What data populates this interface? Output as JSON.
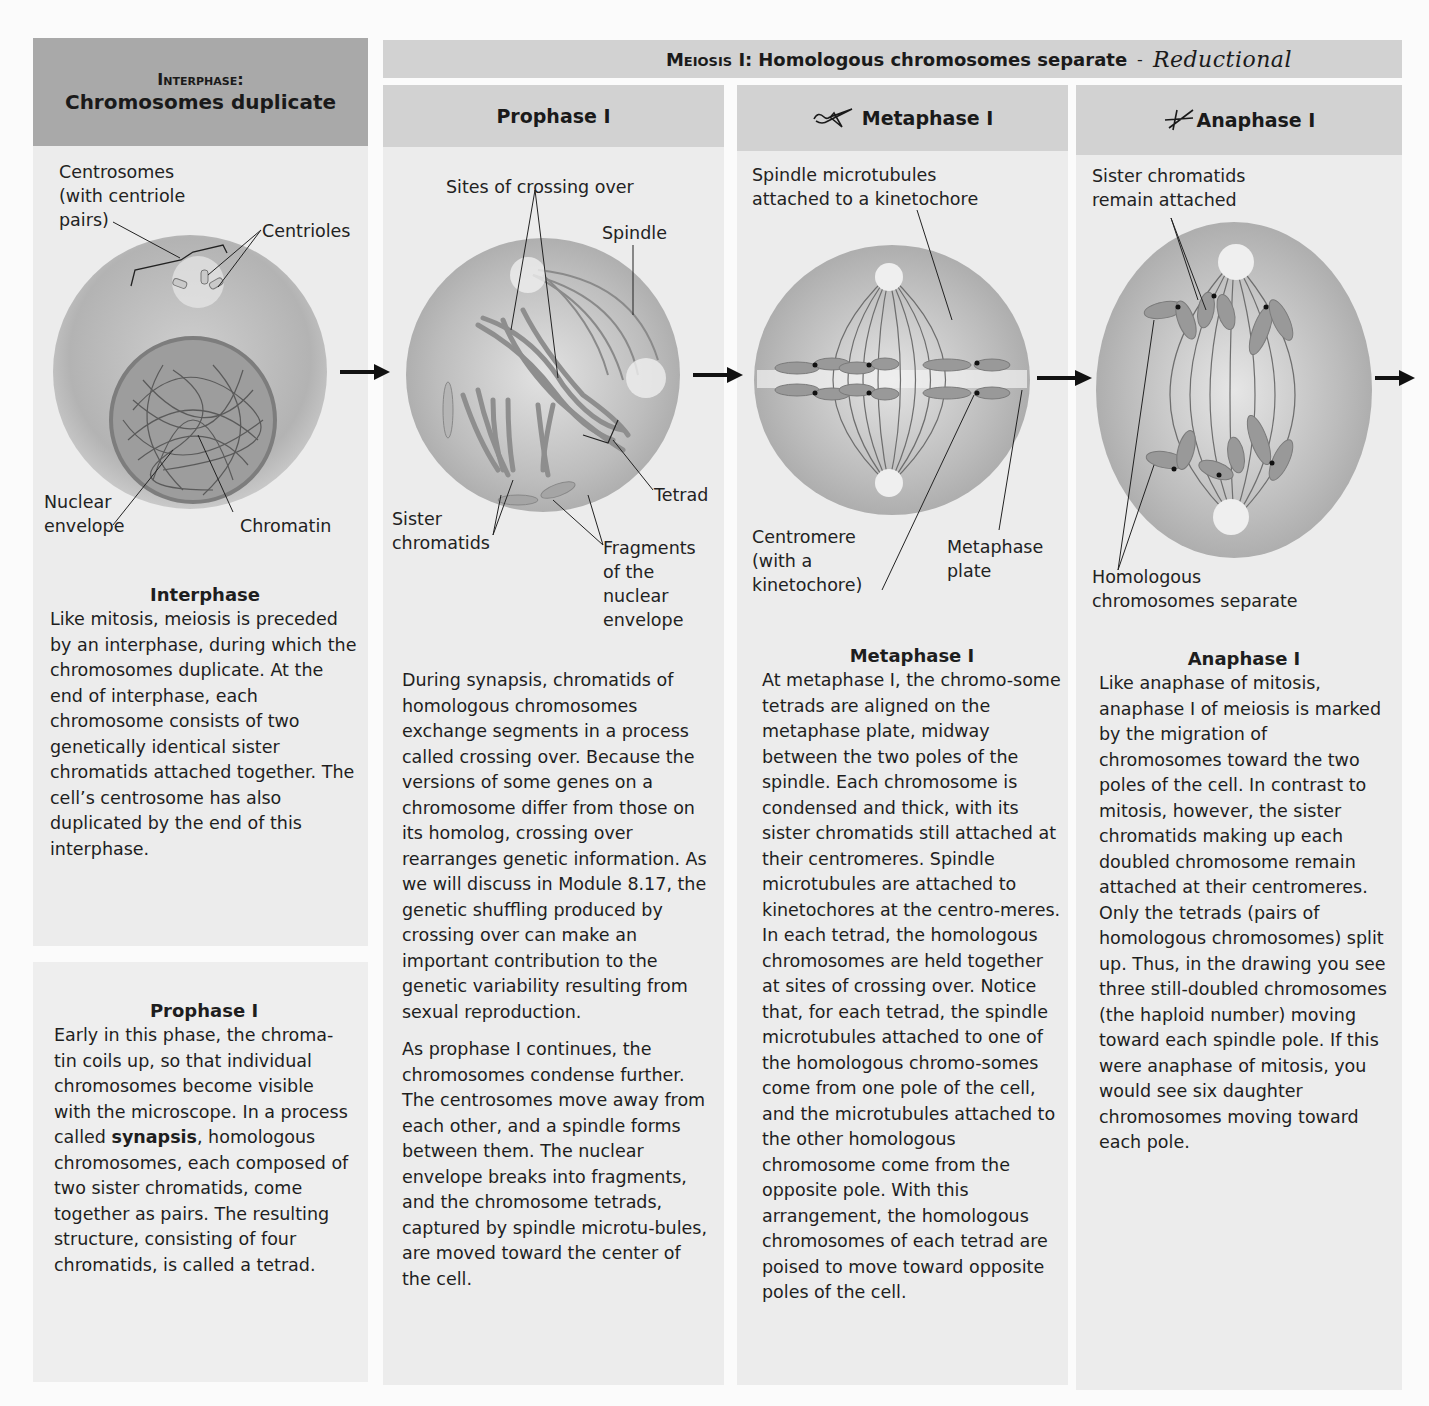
{
  "interphase": {
    "header_line1": "Interphase:",
    "header_line2": "Chromosomes duplicate",
    "labels": {
      "centrosomes": "Centrosomes\n(with centriole\npairs)",
      "centrioles": "Centrioles",
      "nuclear_envelope": "Nuclear\nenvelope",
      "chromatin": "Chromatin"
    },
    "text_title": "Interphase",
    "text_body": "Like mitosis, meiosis is preceded by an interphase, during which the chromosomes duplicate. At the end of interphase, each chromosome consists of two genetically identical sister chromatids attached together. The cell’s centrosome has also duplicated by the end of this interphase.",
    "prophase_box_title": "Prophase I",
    "prophase_box_before": "Early in this phase, the chroma-tin coils up, so that individual chromosomes become visible with the microscope. In a process called ",
    "prophase_box_bold": "synapsis",
    "prophase_box_after": ", homologous chromosomes, each composed of two sister chromatids, come together as pairs. The resulting structure, consisting of four chromatids, is called a tetrad."
  },
  "meiosis_banner": {
    "prefix": "Meiosis I:",
    "title": "Homologous chromosomes separate",
    "dash": "-",
    "handwritten_note": "Reductional"
  },
  "prophase": {
    "header": "Prophase I",
    "labels": {
      "crossing_over": "Sites of crossing over",
      "spindle": "Spindle",
      "tetrad": "Tetrad",
      "sister_chromatids": "Sister\nchromatids",
      "fragments": "Fragments\nof the\nnuclear\nenvelope"
    },
    "text_p1": "During synapsis, chromatids of homologous chromosomes exchange segments in a process called crossing over. Because the versions of some genes on a chromosome differ from those on its homolog, crossing over rearranges genetic information. As we will discuss in Module 8.17, the genetic shuffling produced by crossing over can make an important contribution to the genetic variability resulting from sexual reproduction.",
    "text_p2": "As prophase I continues, the chromosomes condense further. The centrosomes move away from each other, and a spindle forms between them. The nuclear envelope breaks into fragments, and the chromosome tetrads, captured by spindle microtu-bules, are moved toward the center of the cell."
  },
  "metaphase": {
    "header": "Metaphase I",
    "labels": {
      "spindle_microtubules": "Spindle microtubules\nattached to a kinetochore",
      "centromere": "Centromere\n(with a\nkinetochore)",
      "metaphase_plate": "Metaphase\nplate"
    },
    "text_title": "Metaphase I",
    "text_body": "At metaphase I, the chromo-some tetrads are aligned on the metaphase plate, midway between the two poles of the spindle. Each chromosome is condensed and thick, with its sister chromatids still attached at their centromeres. Spindle microtubules are attached to kinetochores at the centro-meres. In each tetrad, the homologous chromosomes are held together at sites of crossing over. Notice that, for each tetrad, the spindle microtubules attached to one of the homologous chromo-somes come from one pole of the cell, and the microtubules attached to the other homologous chromosome come from the opposite pole. With this arrangement, the homologous chromosomes of each tetrad are poised to move toward opposite poles of the cell."
  },
  "anaphase": {
    "header": "Anaphase I",
    "labels": {
      "sister_attached": "Sister chromatids\nremain attached",
      "homologous_separate": "Homologous\nchromosomes separate"
    },
    "text_title": "Anaphase I",
    "text_body": "Like anaphase of mitosis, anaphase I of meiosis is marked by the migration of chromosomes toward the two poles of the cell. In contrast to mitosis, however, the sister chromatids making up each doubled chromosome remain attached at their centromeres. Only the tetrads (pairs of homologous chromosomes) split up. Thus, in the drawing you see three still-doubled chromosomes (the haploid number) moving toward each spindle pole. If this were anaphase of mitosis, you would see six daughter chromosomes moving toward each pole."
  },
  "colors": {
    "dark_header": "#a9a9a9",
    "light_header": "#d2d2d2",
    "panel": "#ececec",
    "cell_fill": "#b8b8b8",
    "chromosome": "#8e8e8e"
  }
}
